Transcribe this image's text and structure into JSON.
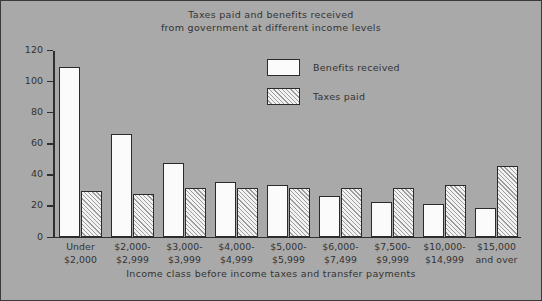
{
  "chart_data": {
    "type": "bar",
    "title": "Taxes paid and benefits received from government at different income levels",
    "title_lines": [
      "Taxes paid and benefits received",
      "from government at different income levels"
    ],
    "xlabel": "Income class before income taxes and transfer payments",
    "ylabel": "",
    "ylim": [
      0,
      120
    ],
    "yticks": [
      0,
      20,
      40,
      60,
      80,
      100,
      120
    ],
    "ytick_labels": [
      "0",
      "20",
      "40",
      "60",
      "80",
      "100",
      "120"
    ],
    "grid": false,
    "legend_position": "upper center",
    "categories": [
      "Under $2,000",
      "$2,000-$2,999",
      "$3,000-$3,999",
      "$4,000-$4,999",
      "$5,000-$5,999",
      "$6,000-$7,499",
      "$7,500-$9,999",
      "$10,000-$14,999",
      "$15,000 and over"
    ],
    "category_lines": [
      [
        "Under",
        "$2,000"
      ],
      [
        "$2,000-",
        "$2,999"
      ],
      [
        "$3,000-",
        "$3,999"
      ],
      [
        "$4,000-",
        "$4,999"
      ],
      [
        "$5,000-",
        "$5,999"
      ],
      [
        "$6,000-",
        "$7,499"
      ],
      [
        "$7,500-",
        "$9,999"
      ],
      [
        "$10,000-",
        "$14,999"
      ],
      [
        "$15,000",
        "and over"
      ]
    ],
    "series": [
      {
        "name": "Benefits received",
        "values": [
          109,
          66,
          47,
          35,
          33,
          26,
          22,
          21,
          18
        ]
      },
      {
        "name": "Taxes paid",
        "values": [
          29,
          27,
          31,
          31,
          31,
          31,
          31,
          33,
          45
        ]
      }
    ]
  },
  "legend": {
    "entries": [
      {
        "label": "Benefits received",
        "swatch": "white-fill"
      },
      {
        "label": "Taxes paid",
        "swatch": "diagonal-hatch"
      }
    ]
  },
  "colors": {
    "background": "#a9a9a9",
    "axis": "#2f2f2f",
    "text": "#333333",
    "benefits_fill": "#fbfbfb",
    "taxes_hatch": "#9d9d9d",
    "bar_outline": "#2b2b2b"
  }
}
